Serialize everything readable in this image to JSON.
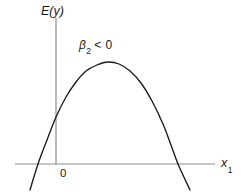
{
  "figure": {
    "background_color": "#ffffff",
    "axis_color": "#8c8c8c",
    "curve_color": "#1a1a1a",
    "text_color": "#1a1a1a"
  },
  "labels": {
    "y_axis": "E(y)",
    "x_axis_base": "x",
    "x_axis_sub": "1",
    "origin": "0",
    "annotation_beta_symbol": "β",
    "annotation_beta_sub": "2",
    "annotation_relation": " < 0"
  },
  "chart_data": {
    "type": "line",
    "title": "",
    "subtitle": "",
    "xlabel": "x1",
    "ylabel": "E(y)",
    "annotations": [
      {
        "text": "β2 < 0",
        "x_px": 79,
        "y_px": 39,
        "meaning": "quadratic coefficient is negative; parabola opens downward"
      },
      {
        "text": "0",
        "x_px": 60,
        "y_px": 168,
        "meaning": "origin tick label"
      }
    ],
    "grid": false,
    "legend": null,
    "axes": {
      "x_axis_pixel_y": 164,
      "x_axis_pixel_x_start": 15,
      "x_axis_pixel_x_end": 215,
      "y_axis_pixel_x": 56,
      "y_axis_pixel_y_top": 18,
      "y_axis_pixel_y_bottom": 164,
      "ticks": [],
      "tick_labels": []
    },
    "curve": {
      "name": "E(y) = b0 + b1*x1 + b2*x1^2",
      "shape": "downward-opening parabola",
      "vertex_px": [
        108,
        62
      ],
      "roots_px": [
        38,
        178
      ],
      "y_intercept_px": 117,
      "path_points_px": [
        [
          30,
          190
        ],
        [
          38,
          164
        ],
        [
          47,
          140
        ],
        [
          56,
          117
        ],
        [
          66,
          97
        ],
        [
          76,
          82
        ],
        [
          86,
          71
        ],
        [
          97,
          65
        ],
        [
          108,
          62
        ],
        [
          119,
          64
        ],
        [
          130,
          71
        ],
        [
          141,
          83
        ],
        [
          152,
          101
        ],
        [
          163,
          124
        ],
        [
          171,
          145
        ],
        [
          178,
          164
        ],
        [
          190,
          190
        ]
      ]
    }
  }
}
